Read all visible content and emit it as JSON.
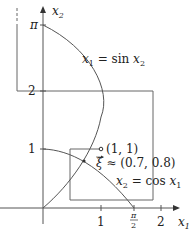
{
  "diagram": {
    "type": "fixed-point iteration phase plot",
    "axes": {
      "x_label": "x",
      "x_label_sub": "1",
      "y_label": "x",
      "y_label_sub": "2",
      "x_ticks": [
        {
          "label": "1",
          "value": 1
        },
        {
          "label_num": "π",
          "label_den": "2",
          "value": 1.5708
        },
        {
          "label": "2",
          "value": 2
        }
      ],
      "y_ticks": [
        {
          "label": "1",
          "value": 1
        },
        {
          "label": "2",
          "value": 2
        },
        {
          "label": "π",
          "value": 3.1416
        }
      ]
    },
    "curves": [
      {
        "name": "sin-curve",
        "label_lhs": "x",
        "label_lhs_sub": "1",
        "label_eq": " = sin ",
        "label_rhs": "x",
        "label_rhs_sub": "2"
      },
      {
        "name": "cos-curve",
        "label_lhs": "x",
        "label_lhs_sub": "2",
        "label_eq": " = cos ",
        "label_rhs": "x",
        "label_rhs_sub": "1"
      }
    ],
    "points": [
      {
        "name": "start-point",
        "label": "(1, 1)",
        "x": 1,
        "y": 1
      },
      {
        "name": "fixed-point",
        "symbol": "ξ",
        "label": " ≈ (0.7, 0.8)",
        "x": 0.7,
        "y": 0.8
      }
    ],
    "colors": {
      "line": "#555555",
      "text": "#222222",
      "background": "#ffffff"
    }
  }
}
